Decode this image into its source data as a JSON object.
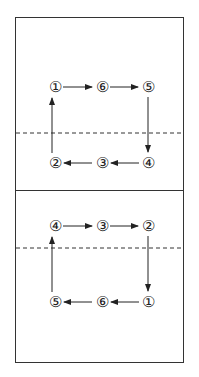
{
  "diagram": {
    "title": "",
    "top_half": {
      "nodes": [
        {
          "label": "①",
          "x": 55,
          "y": 87
        },
        {
          "label": "⑥",
          "x": 102,
          "y": 87
        },
        {
          "label": "⑤",
          "x": 148,
          "y": 87
        },
        {
          "label": "②",
          "x": 55,
          "y": 163
        },
        {
          "label": "③",
          "x": 102,
          "y": 163
        },
        {
          "label": "④",
          "x": 148,
          "y": 163
        }
      ],
      "flow": [
        "①",
        "⑥",
        "⑤",
        "④",
        "③",
        "②",
        "①"
      ]
    },
    "bottom_half": {
      "nodes": [
        {
          "label": "④",
          "x": 55,
          "y": 226
        },
        {
          "label": "③",
          "x": 102,
          "y": 226
        },
        {
          "label": "②",
          "x": 148,
          "y": 226
        },
        {
          "label": "⑤",
          "x": 55,
          "y": 302
        },
        {
          "label": "⑥",
          "x": 102,
          "y": 302
        },
        {
          "label": "①",
          "x": 148,
          "y": 302
        }
      ],
      "flow": [
        "①",
        "⑥",
        "⑤",
        "④",
        "③",
        "②"
      ]
    },
    "colors": {
      "line": "#222222",
      "background": "#ffffff"
    }
  }
}
